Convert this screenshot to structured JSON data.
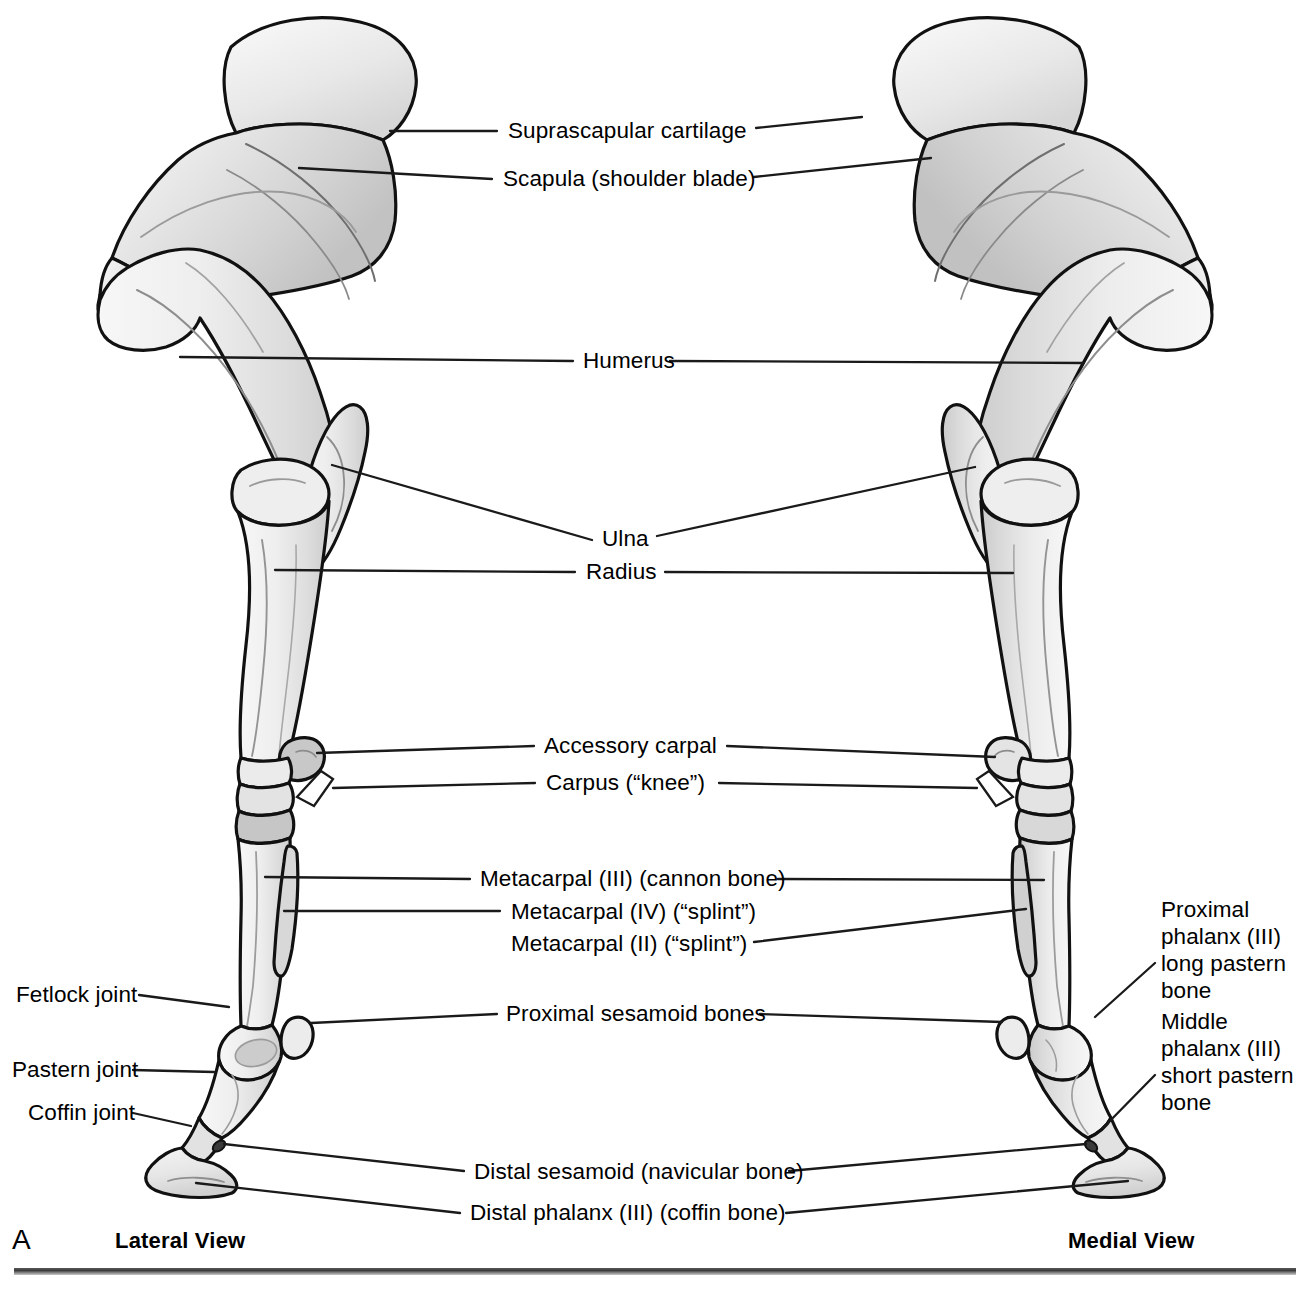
{
  "figure": {
    "panel_letter": "A",
    "left_view_label": "Lateral View",
    "right_view_label": "Medial View"
  },
  "labels": {
    "suprascapular_cartilage": "Suprascapular cartilage",
    "scapula": "Scapula (shoulder blade)",
    "humerus": "Humerus",
    "ulna": "Ulna",
    "radius": "Radius",
    "accessory_carpal": "Accessory carpal",
    "carpus": "Carpus (“knee”)",
    "metacarpal_iii": "Metacarpal (III) (cannon bone)",
    "metacarpal_iv": "Metacarpal (IV) (“splint”)",
    "metacarpal_ii": "Metacarpal (II) (“splint”)",
    "proximal_sesamoid": "Proximal sesamoid bones",
    "distal_sesamoid": "Distal sesamoid (navicular bone)",
    "distal_phalanx": "Distal phalanx (III) (coffin bone)",
    "fetlock_joint": "Fetlock joint",
    "pastern_joint": "Pastern joint",
    "coffin_joint": "Coffin joint",
    "proximal_phalanx": "Proximal\nphalanx (III)\nlong pastern\nbone",
    "middle_phalanx": "Middle\nphalanx (III)\nshort pastern\nbone"
  },
  "label_lines": {
    "proximal_phalanx": [
      "Proximal",
      "phalanx (III)",
      "long pastern",
      "bone"
    ],
    "middle_phalanx": [
      "Middle",
      "phalanx (III)",
      "short pastern",
      "bone"
    ]
  },
  "colors": {
    "outline": "#111111",
    "bone_fill": "#e9e9e9",
    "bone_light": "#f6f6f6",
    "bone_shade": "#cfcfcf",
    "bone_deep_shade": "#b4b4b4",
    "leader_line": "#1a1a1a",
    "text": "#000000",
    "background": "#ffffff",
    "rule_dark": "#3b3b3b",
    "rule_light": "#c9c9c9"
  },
  "diagram_meta": {
    "type": "anatomical-illustration",
    "subject": "Equine forelimb skeleton",
    "views": 2,
    "leader_count": 26
  }
}
